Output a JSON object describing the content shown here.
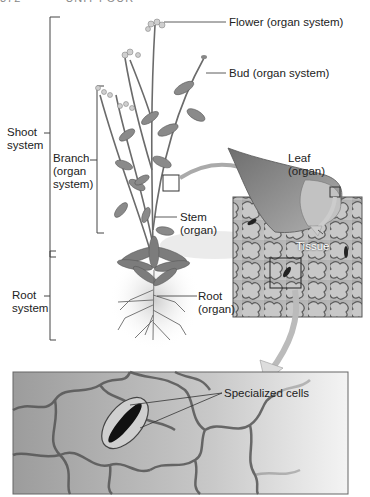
{
  "header": {
    "page_number": "372",
    "running_head": "UNIT FOUR"
  },
  "labels": {
    "flower": "Flower (organ system)",
    "bud": "Bud (organ system)",
    "shoot_system": "Shoot\nsystem",
    "branch": "Branch\n(organ\nsystem)",
    "leaf": "Leaf\n(organ)",
    "stem": "Stem\n(organ)",
    "tissue": "Tissue",
    "root_system": "Root\nsystem",
    "root": "Root\n(organ)",
    "specialized_cells": "Specialized cells"
  },
  "colors": {
    "plant_green": "#7a7a7a",
    "leaf_gray": "#8e8e8e",
    "tissue_bg": "#b8b8b8",
    "cell_outline": "#555555",
    "line": "#333333"
  }
}
